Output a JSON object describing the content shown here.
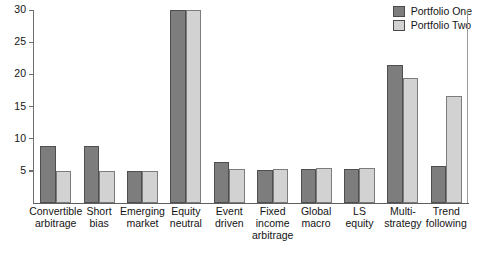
{
  "chart_data": {
    "type": "bar",
    "title": "",
    "xlabel": "",
    "ylabel": "",
    "ylim": [
      0,
      30
    ],
    "yticks": [
      0,
      5,
      10,
      15,
      20,
      25,
      30
    ],
    "ytick_labels": [
      "0",
      "5",
      "10",
      "15",
      "20",
      "25",
      "30"
    ],
    "grid": false,
    "legend_position": "top-right",
    "categories": [
      "Convertible arbitrage",
      "Short bias",
      "Emerging market",
      "Equity neutral",
      "Event driven",
      "Fixed income arbitrage",
      "Global macro",
      "LS equity",
      "Multi-strategy",
      "Trend following"
    ],
    "category_lines": [
      [
        "Convertible",
        "arbitrage"
      ],
      [
        "Short",
        "bias"
      ],
      [
        "Emerging",
        "market"
      ],
      [
        "Equity",
        "neutral"
      ],
      [
        "Event",
        "driven"
      ],
      [
        "Fixed",
        "income",
        "arbitrage"
      ],
      [
        "Global",
        "macro"
      ],
      [
        "LS",
        "equity"
      ],
      [
        "Multi-",
        "strategy"
      ],
      [
        "Trend",
        "following"
      ]
    ],
    "series": [
      {
        "name": "Portfolio One",
        "color": "#7d7d7d",
        "values": [
          8.8,
          8.8,
          5.0,
          30.0,
          6.3,
          5.2,
          5.3,
          5.3,
          21.4,
          5.7
        ]
      },
      {
        "name": "Portfolio Two",
        "color": "#d2d2d2",
        "values": [
          4.9,
          5.0,
          5.0,
          30.0,
          5.3,
          5.3,
          5.4,
          5.4,
          19.4,
          16.6
        ]
      }
    ]
  },
  "legend": {
    "items": [
      {
        "label": "Portfolio One",
        "color": "#7d7d7d"
      },
      {
        "label": "Portfolio Two",
        "color": "#d2d2d2"
      }
    ]
  }
}
